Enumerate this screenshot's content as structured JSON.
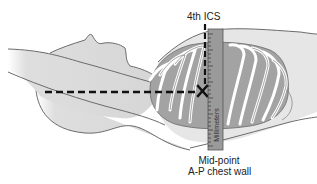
{
  "diagram": {
    "labels": {
      "top_landmark": "4th ICS",
      "bottom_line1": "Mid-point",
      "bottom_line2": "A-P chest wall",
      "ruler": "Millimeters"
    },
    "markers": {
      "intersection": "X"
    },
    "colors": {
      "body_fill": "#d9d9d9",
      "outline": "#6b6b6b",
      "ribs": "#ffffff",
      "lung": "#a3a3a3",
      "ruler_fill": "#9a9a9a",
      "dashed_line": "#111111"
    }
  }
}
